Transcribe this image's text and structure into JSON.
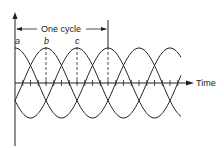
{
  "diagram": {
    "type": "three-phase-sine-waveforms",
    "x_axis_label": "Time",
    "cycle_label": "One cycle",
    "phase_labels": [
      "a",
      "b",
      "c"
    ],
    "phases": [
      {
        "name": "a",
        "peak_x": 15
      },
      {
        "name": "b",
        "peak_x": 46
      },
      {
        "name": "c",
        "peak_x": 77
      }
    ],
    "cycle_end_x": 108,
    "period_px": 93,
    "amplitude_px": 35,
    "axis_y": 83,
    "origin_x": 15,
    "line_color": "#222222"
  }
}
